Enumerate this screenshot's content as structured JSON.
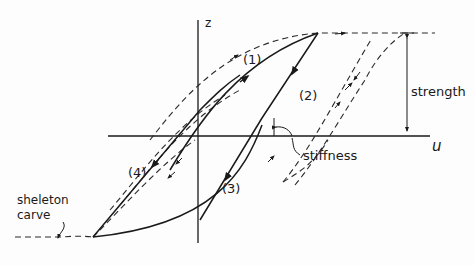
{
  "figure": {
    "axes": {
      "vertical_label": "z",
      "horizontal_label": "u"
    },
    "branch_labels": [
      "(1)",
      "(2)",
      "(3)",
      "(4)"
    ],
    "annotations": {
      "strength": "strength",
      "stiffness": "stiffness",
      "skeleton_line1": "sheleton",
      "skeleton_line2": "carve"
    },
    "colors": {
      "ink": "#1a1a1a",
      "background": "#fdfdfd"
    }
  }
}
